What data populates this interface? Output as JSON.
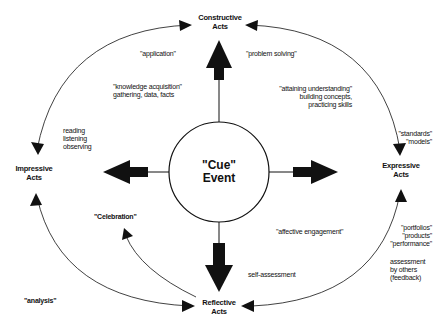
{
  "center": {
    "line1": "\"Cue\"",
    "line2": "Event"
  },
  "nodes": {
    "constructive": {
      "line1": "Constructive",
      "line2": "Acts"
    },
    "impressive": {
      "line1": "Impressive",
      "line2": "Acts"
    },
    "expressive": {
      "line1": "Expressive",
      "line2": "Acts"
    },
    "reflective": {
      "line1": "Reflective",
      "line2": "Acts"
    }
  },
  "labels": {
    "application": "\"application\"",
    "problem_solving": "\"problem solving\"",
    "knowledge_acquisition": [
      "\"knowledge acquisition\"",
      "gathering, data, facts"
    ],
    "attaining_understanding": [
      "\"attaining understanding\"",
      "building concepts,",
      "practicing skills"
    ],
    "reading_listening": [
      "reading",
      "listening",
      "observing"
    ],
    "standards_models": [
      "\"standards\"",
      "\"models\""
    ],
    "celebration": "\"Celebration\"",
    "affective_engagement": "\"affective engagement\"",
    "portfolios": [
      "\"portfolios\"",
      "\"products\"",
      "\"performance\""
    ],
    "self_assessment": "self-assessment",
    "assessment_by_others": [
      "assessment",
      "by others",
      "(feedback)"
    ],
    "analysis": "\"analysis\""
  },
  "colors": {
    "ink": "#111111",
    "background": "#ffffff"
  }
}
